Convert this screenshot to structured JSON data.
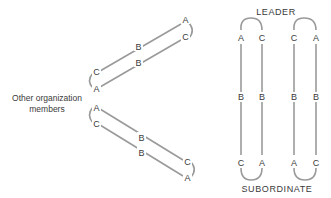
{
  "diagram": {
    "left_label_line1": "Other organization",
    "left_label_line2": "members",
    "leader_label": "LEADER",
    "subordinate_label": "SUBORDINATE",
    "upper_loop": {
      "far_end_top": "A",
      "far_end_bottom": "C",
      "mid_top": "B",
      "mid_bottom": "B",
      "near_end_top": "C",
      "near_end_bottom": "A"
    },
    "lower_loop": {
      "near_end_top": "A",
      "near_end_bottom": "C",
      "mid_top": "B",
      "mid_bottom": "B",
      "far_end_top": "C",
      "far_end_bottom": "A"
    },
    "vertical_loop_1": {
      "top_left": "A",
      "top_right": "C",
      "mid_left": "B",
      "mid_right": "B",
      "bottom_left": "C",
      "bottom_right": "A"
    },
    "vertical_loop_2": {
      "top_left": "C",
      "top_right": "A",
      "mid_left": "B",
      "mid_right": "B",
      "bottom_left": "A",
      "bottom_right": "C"
    },
    "colors": {
      "line": "#9a9a9a",
      "text": "#3a3a3a",
      "background": "#ffffff"
    }
  }
}
